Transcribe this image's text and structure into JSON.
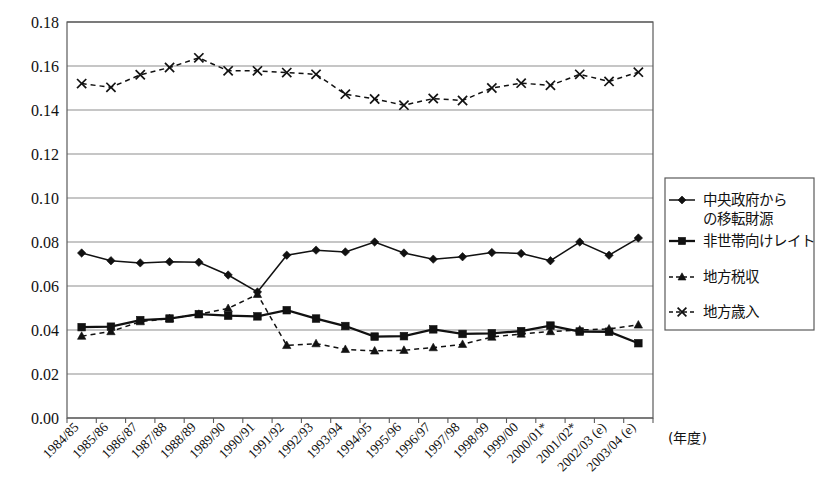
{
  "chart_data": {
    "type": "line",
    "title": "",
    "xlabel": "(年度)",
    "ylabel": "",
    "ylim": [
      0.0,
      0.18
    ],
    "ytick_step": 0.02,
    "ytick_labels": [
      "0.18",
      "0.16",
      "0.14",
      "0.12",
      "0.10",
      "0.08",
      "0.06",
      "0.04",
      "0.02",
      "0.00"
    ],
    "ytick_values": [
      0.18,
      0.16,
      0.14,
      0.12,
      0.1,
      0.08,
      0.06,
      0.04,
      0.02,
      0.0
    ],
    "grid": true,
    "legend_position": "right",
    "categories": [
      "1984/85",
      "1985/86",
      "1986/87",
      "1987/88",
      "1988/89",
      "1989/90",
      "1990/91",
      "1991/92",
      "1992/93",
      "1993/94",
      "1994/95",
      "1995/96",
      "1996/97",
      "1997/98",
      "1998/99",
      "1999/00",
      "2000/01*",
      "2001/02*",
      "2002/03 (e)",
      "2003/04 (e)"
    ],
    "series": [
      {
        "name": "中央政府からの移転財源",
        "marker": "diamond",
        "dash": "solid",
        "values": [
          0.075,
          0.0715,
          0.0705,
          0.071,
          0.0708,
          0.065,
          0.0573,
          0.074,
          0.0763,
          0.0755,
          0.08,
          0.075,
          0.0722,
          0.0733,
          0.0752,
          0.0748,
          0.0715,
          0.08,
          0.074,
          0.0818
        ]
      },
      {
        "name": "非世帯向けレイト",
        "marker": "square",
        "dash": "solid",
        "values": [
          0.0413,
          0.0415,
          0.0445,
          0.0452,
          0.0472,
          0.0465,
          0.0462,
          0.049,
          0.0452,
          0.0418,
          0.037,
          0.0372,
          0.0403,
          0.0382,
          0.0385,
          0.0395,
          0.042,
          0.0393,
          0.0392,
          0.034
        ]
      },
      {
        "name": "地方税収",
        "marker": "triangle",
        "dash": "dashed",
        "values": [
          0.0372,
          0.0393,
          0.0438,
          0.0452,
          0.0472,
          0.0498,
          0.0562,
          0.033,
          0.0338,
          0.0312,
          0.0305,
          0.0308,
          0.032,
          0.0335,
          0.0368,
          0.0382,
          0.0393,
          0.04,
          0.0405,
          0.0423
        ]
      },
      {
        "name": "地方歳入",
        "marker": "cross",
        "dash": "dashed",
        "values": [
          0.152,
          0.1503,
          0.156,
          0.1593,
          0.1637,
          0.1578,
          0.1578,
          0.157,
          0.1562,
          0.1472,
          0.145,
          0.1422,
          0.1452,
          0.1443,
          0.15,
          0.1522,
          0.1512,
          0.1562,
          0.153,
          0.1572
        ]
      }
    ]
  },
  "legend": {
    "items": [
      {
        "label_line1": "中央政府から",
        "label_line2": "の移転財源",
        "marker": "diamond-marker-icon"
      },
      {
        "label_line1": "非世帯向けレイト",
        "label_line2": "",
        "marker": "square-marker-icon"
      },
      {
        "label_line1": "地方税収",
        "label_line2": "",
        "marker": "triangle-marker-icon"
      },
      {
        "label_line1": "地方歳入",
        "label_line2": "",
        "marker": "cross-marker-icon"
      }
    ]
  },
  "axis": {
    "x_unit": "(年度)"
  }
}
